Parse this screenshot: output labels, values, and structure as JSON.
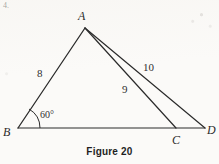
{
  "figure": {
    "caption": "Figure 20",
    "corner_mark": "4.",
    "stroke_color": "#2b2b2b",
    "background_color": "#fbfaf8"
  },
  "vertices": [
    {
      "id": "A",
      "label": "A",
      "x": 85,
      "y": 28,
      "label_x": 78,
      "label_y": 10
    },
    {
      "id": "B",
      "label": "B",
      "x": 18,
      "y": 128,
      "label_x": 3,
      "label_y": 126
    },
    {
      "id": "C",
      "label": "C",
      "x": 176,
      "y": 128,
      "label_x": 172,
      "label_y": 134
    },
    {
      "id": "D",
      "label": "D",
      "x": 205,
      "y": 128,
      "label_x": 207,
      "label_y": 124
    }
  ],
  "segments": [
    {
      "id": "AB",
      "from": "A",
      "to": "B",
      "length_label": "8"
    },
    {
      "id": "AC",
      "from": "A",
      "to": "C",
      "length_label": "9"
    },
    {
      "id": "AD",
      "from": "A",
      "to": "D",
      "length_label": "10"
    },
    {
      "id": "BD",
      "from": "B",
      "to": "D",
      "length_label": ""
    }
  ],
  "length_labels": [
    {
      "for": "AB",
      "text": "8",
      "x": 37,
      "y": 68
    },
    {
      "for": "AC",
      "text": "9",
      "x": 122,
      "y": 84
    },
    {
      "for": "AD",
      "text": "10",
      "x": 143,
      "y": 62
    }
  ],
  "angles": [
    {
      "at": "B",
      "text": "60°",
      "label_x": 40,
      "label_y": 110,
      "arc_radius": 22
    }
  ]
}
